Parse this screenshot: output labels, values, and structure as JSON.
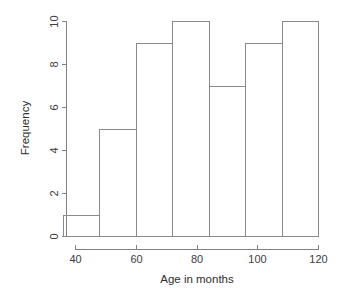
{
  "chart_data": {
    "type": "bar",
    "title": "",
    "subtitle": "",
    "xlabel": "Age in months",
    "ylabel": "Frequency",
    "xlim": [
      36,
      120
    ],
    "ylim": [
      0,
      10
    ],
    "xticks": [
      40,
      60,
      80,
      100,
      120
    ],
    "xtick_labels": [
      "40",
      "60",
      "80",
      "100",
      "120"
    ],
    "yticks": [
      0,
      2,
      4,
      6,
      8,
      10
    ],
    "ytick_labels": [
      "0",
      "2",
      "4",
      "6",
      "8",
      "10"
    ],
    "grid": false,
    "legend": false,
    "legend_position": "none",
    "bin_width": 12,
    "bin_edges": [
      36,
      48,
      60,
      72,
      84,
      96,
      108,
      120
    ],
    "categories": [
      "36-48",
      "48-60",
      "60-72",
      "72-84",
      "84-96",
      "96-108",
      "108-120"
    ],
    "values": [
      1,
      5,
      9,
      10,
      7,
      9,
      10
    ],
    "bars": [
      {
        "label": "36-48",
        "x0": 36,
        "x1": 48,
        "value": 1
      },
      {
        "label": "48-60",
        "x0": 48,
        "x1": 60,
        "value": 5
      },
      {
        "label": "60-72",
        "x0": 60,
        "x1": 72,
        "value": 9
      },
      {
        "label": "72-84",
        "x0": 72,
        "x1": 84,
        "value": 10
      },
      {
        "label": "84-96",
        "x0": 84,
        "x1": 96,
        "value": 7
      },
      {
        "label": "96-108",
        "x0": 96,
        "x1": 108,
        "value": 9
      },
      {
        "label": "108-120",
        "x0": 108,
        "x1": 120,
        "value": 10
      }
    ],
    "colors": {
      "background": "#ffffff",
      "bar_fill": "none",
      "bar_stroke": "#8a8a8a",
      "axis": "#808080",
      "text": "#2e2e2e"
    }
  }
}
